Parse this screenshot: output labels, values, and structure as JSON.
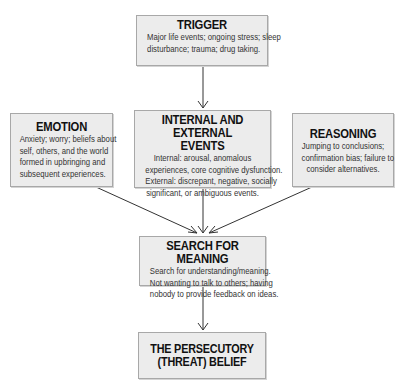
{
  "diagram": {
    "type": "flowchart",
    "colors": {
      "box_fill": "#ececec",
      "box_border": "#a8a8a8",
      "arrow": "#333333",
      "background": "#ffffff"
    },
    "nodes": {
      "trigger": {
        "title": "TRIGGER",
        "lines": [
          "Major life events; ongoing stress; sleep",
          "disturbance; trauma; drug taking."
        ]
      },
      "events": {
        "title_lines": [
          "INTERNAL AND EXTERNAL",
          "EVENTS"
        ],
        "lines": [
          "Internal: arousal, anomalous",
          "experiences, core cognitive dysfunction.",
          "External: discrepant, negative, socially",
          "significant, or ambiguous events."
        ]
      },
      "emotion": {
        "title": "EMOTION",
        "lines": [
          "Anxiety; worry; beliefs about",
          "self, others, and the world",
          "formed in upbringing and",
          "subsequent experiences."
        ]
      },
      "reasoning": {
        "title": "REASONING",
        "lines": [
          "Jumping to conclusions;",
          "confirmation bias; failure to",
          "consider alternatives."
        ]
      },
      "search": {
        "title": "SEARCH FOR MEANING",
        "lines": [
          "Search for understanding/meaning.",
          "Not wanting to talk to others; having",
          "nobody to provide feedback on ideas."
        ]
      },
      "belief": {
        "title_lines": [
          "THE PERSECUTORY",
          "(THREAT) BELIEF"
        ]
      }
    },
    "edges": [
      {
        "from": "trigger",
        "to": "events"
      },
      {
        "from": "emotion",
        "to": "search"
      },
      {
        "from": "events",
        "to": "search"
      },
      {
        "from": "reasoning",
        "to": "search"
      },
      {
        "from": "search",
        "to": "belief"
      }
    ]
  }
}
